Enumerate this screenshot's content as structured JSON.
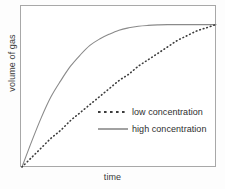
{
  "chart_data": {
    "type": "line",
    "title": "",
    "xlabel": "time",
    "ylabel": "volume of gas",
    "grid": false,
    "axis_ticks": false,
    "legend_position": "center-right",
    "xlim": [
      0,
      100
    ],
    "ylim": [
      0,
      100
    ],
    "plateau_value": 89,
    "series": [
      {
        "name": "low concentration",
        "style": "dotted",
        "color": "#3c3c3c",
        "x": [
          0,
          5,
          10,
          15,
          20,
          25,
          30,
          35,
          40,
          45,
          50,
          55,
          60,
          65,
          70,
          75,
          80,
          85,
          90,
          95,
          100
        ],
        "y": [
          0,
          6,
          12,
          18,
          23,
          29,
          34,
          39,
          44,
          49,
          54,
          58,
          63,
          67,
          71,
          75,
          79,
          82,
          85,
          87,
          89
        ]
      },
      {
        "name": "high concentration",
        "style": "solid",
        "color": "#8a8a8a",
        "x": [
          0,
          5,
          10,
          15,
          20,
          25,
          30,
          35,
          40,
          45,
          50,
          55,
          60,
          65,
          70,
          75,
          80,
          85,
          90,
          95,
          100
        ],
        "y": [
          0,
          16,
          31,
          44,
          54,
          63,
          70,
          76,
          80,
          83,
          85.5,
          87,
          88,
          88.5,
          88.8,
          89,
          89,
          89,
          89,
          89,
          89
        ]
      }
    ],
    "annotations": []
  },
  "legend": {
    "items": [
      {
        "label": "low concentration",
        "marker": "dashed-line-marker"
      },
      {
        "label": "high concentration",
        "marker": "solid-line-marker"
      }
    ]
  },
  "colors": {
    "frame": "#a8a8a8",
    "background": "#ffffff",
    "text": "#2e2e2e",
    "dotted_curve": "#3c3c3c",
    "solid_curve": "#8a8a8a"
  }
}
